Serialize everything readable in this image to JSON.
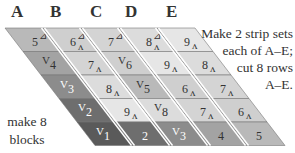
{
  "column_labels": [
    {
      "label": "A",
      "x": 11
    },
    {
      "label": "B",
      "x": 50
    },
    {
      "label": "C",
      "x": 90
    },
    {
      "label": "D",
      "x": 125
    },
    {
      "label": "E",
      "x": 166
    }
  ],
  "instructions": {
    "line1": "Make 2 strip sets",
    "line2": "each of A–E;",
    "line3": "cut 8 rows",
    "line4": "A–E."
  },
  "left_note": {
    "line1": "make 8",
    "line2": "blocks"
  },
  "geometry": {
    "row_height": 23.5,
    "top_y": 28,
    "row_shift_x": 18,
    "cell_width": 38,
    "top_left_x": 5,
    "skew_x": 24
  },
  "rows": [
    {
      "cells": [
        {
          "number": "5",
          "mark": "tri",
          "fill": "#b9b9b9",
          "text_color": "#333"
        },
        {
          "number": "6",
          "mark": "tri-up",
          "fill": "#cfcfcf",
          "text_color": "#333"
        },
        {
          "number": "7",
          "mark": "tri",
          "fill": "#d4d4d4",
          "text_color": "#333"
        },
        {
          "number": "8",
          "mark": "tri-up",
          "fill": "#dcdcdc",
          "text_color": "#333"
        },
        {
          "number": "9",
          "mark": "up",
          "fill": "#e6e6e6",
          "text_color": "#333"
        }
      ]
    },
    {
      "cells": [
        {
          "number": "4",
          "mark": "down",
          "fill": "#a3a3a3",
          "text_color": "#333"
        },
        {
          "number": "7",
          "mark": "up",
          "fill": "#d4d4d4",
          "text_color": "#333"
        },
        {
          "number": "6",
          "mark": "down",
          "fill": "#cfcfcf",
          "text_color": "#333"
        },
        {
          "number": "9",
          "mark": "up",
          "fill": "#e6e6e6",
          "text_color": "#333"
        },
        {
          "number": "8",
          "mark": "up",
          "fill": "#dcdcdc",
          "text_color": "#333"
        }
      ]
    },
    {
      "cells": [
        {
          "number": "3",
          "mark": "down",
          "fill": "#8c8c8c",
          "text_color": "#ffffff"
        },
        {
          "number": "8",
          "mark": "up",
          "fill": "#dcdcdc",
          "text_color": "#333"
        },
        {
          "number": "5",
          "mark": "down",
          "fill": "#b9b9b9",
          "text_color": "#333"
        },
        {
          "number": "6",
          "mark": "up",
          "fill": "#cfcfcf",
          "text_color": "#333"
        },
        {
          "number": "7",
          "mark": "up",
          "fill": "#d4d4d4",
          "text_color": "#333"
        }
      ]
    },
    {
      "cells": [
        {
          "number": "2",
          "mark": "down",
          "fill": "#6e6e6e",
          "text_color": "#ffffff"
        },
        {
          "number": "9",
          "mark": "up",
          "fill": "#e6e6e6",
          "text_color": "#333"
        },
        {
          "number": "8",
          "mark": "down",
          "fill": "#dcdcdc",
          "text_color": "#333"
        },
        {
          "number": "7",
          "mark": "up",
          "fill": "#d4d4d4",
          "text_color": "#333"
        },
        {
          "number": "6",
          "mark": "up",
          "fill": "#cfcfcf",
          "text_color": "#333"
        }
      ]
    },
    {
      "cells": [
        {
          "number": "1",
          "mark": "down",
          "fill": "#5a5a5a",
          "text_color": "#ffffff"
        },
        {
          "number": "2",
          "mark": "none",
          "fill": "#6e6e6e",
          "text_color": "#ffffff"
        },
        {
          "number": "3",
          "mark": "down",
          "fill": "#8c8c8c",
          "text_color": "#ffffff"
        },
        {
          "number": "4",
          "mark": "none",
          "fill": "#a3a3a3",
          "text_color": "#333"
        },
        {
          "number": "5",
          "mark": "none",
          "fill": "#b9b9b9",
          "text_color": "#333"
        }
      ]
    }
  ]
}
